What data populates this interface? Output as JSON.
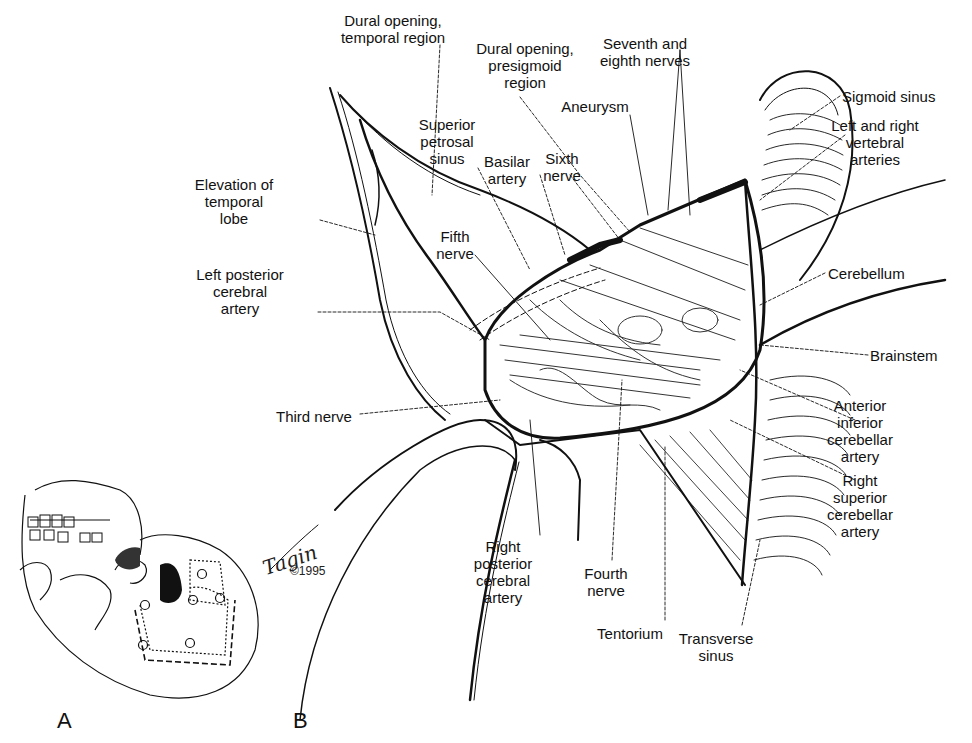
{
  "figure": {
    "panels": [
      {
        "id": "A",
        "label": "A",
        "description": "Skull with outlined craniotomy and burr holes"
      },
      {
        "id": "B",
        "label": "B",
        "description": "Combined supra- and infratentorial presigmoid exposure"
      }
    ],
    "signature": {
      "artist": "Tagin",
      "copyright": "©1995"
    },
    "labels": [
      {
        "id": "dural-opening-temporal",
        "text": "Dural opening,\ntemporal region",
        "x": 393,
        "y": 12,
        "align": "center"
      },
      {
        "id": "dural-opening-presigmoid",
        "text": "Dural opening,\npresigmoid\nregion",
        "x": 525,
        "y": 40,
        "align": "center"
      },
      {
        "id": "seventh-eighth-nerves",
        "text": "Seventh and\neighth nerves",
        "x": 645,
        "y": 35,
        "align": "center"
      },
      {
        "id": "aneurysm",
        "text": "Aneurysm",
        "x": 595,
        "y": 98,
        "align": "center"
      },
      {
        "id": "sigmoid-sinus",
        "text": "Sigmoid sinus",
        "x": 842,
        "y": 88,
        "align": "left"
      },
      {
        "id": "vertebral-arteries",
        "text": "Left and right\nvertebral\narteries",
        "x": 875,
        "y": 117,
        "align": "center"
      },
      {
        "id": "superior-petrosal-sinus",
        "text": "Superior\npetrosal\nsinus",
        "x": 447,
        "y": 116,
        "align": "center"
      },
      {
        "id": "basilar-artery",
        "text": "Basilar\nartery",
        "x": 507,
        "y": 153,
        "align": "center"
      },
      {
        "id": "sixth-nerve",
        "text": "Sixth\nnerve",
        "x": 562,
        "y": 150,
        "align": "center"
      },
      {
        "id": "elevation-temporal-lobe",
        "text": "Elevation of\ntemporal\nlobe",
        "x": 234,
        "y": 176,
        "align": "center"
      },
      {
        "id": "fifth-nerve",
        "text": "Fifth\nnerve",
        "x": 455,
        "y": 228,
        "align": "center"
      },
      {
        "id": "left-posterior-cerebral-artery",
        "text": "Left posterior\ncerebral\nartery",
        "x": 240,
        "y": 266,
        "align": "center"
      },
      {
        "id": "cerebellum",
        "text": "Cerebellum",
        "x": 828,
        "y": 265,
        "align": "left"
      },
      {
        "id": "brainstem",
        "text": "Brainstem",
        "x": 870,
        "y": 347,
        "align": "left"
      },
      {
        "id": "third-nerve",
        "text": "Third nerve",
        "x": 276,
        "y": 408,
        "align": "left"
      },
      {
        "id": "anterior-inferior-cerebellar-artery",
        "text": "Anterior\ninferior\ncerebellar\nartery",
        "x": 860,
        "y": 397,
        "align": "center"
      },
      {
        "id": "right-superior-cerebellar-artery",
        "text": "Right\nsuperior\ncerebellar\nartery",
        "x": 860,
        "y": 472,
        "align": "center"
      },
      {
        "id": "right-posterior-cerebral-artery",
        "text": "Right\nposterior\ncerebral\nartery",
        "x": 503,
        "y": 538,
        "align": "center"
      },
      {
        "id": "fourth-nerve",
        "text": "Fourth\nnerve",
        "x": 606,
        "y": 565,
        "align": "center"
      },
      {
        "id": "tentorium",
        "text": "Tentorium",
        "x": 630,
        "y": 625,
        "align": "center"
      },
      {
        "id": "transverse-sinus",
        "text": "Transverse\nsinus",
        "x": 716,
        "y": 630,
        "align": "center"
      }
    ]
  }
}
